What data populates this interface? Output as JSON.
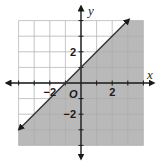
{
  "chart_data": {
    "type": "line",
    "title": "",
    "subtitle": "",
    "xlabel": "x",
    "ylabel": "y",
    "origin_label": "O",
    "xlim": [
      -4,
      4
    ],
    "ylim": [
      -4,
      4
    ],
    "grid": true,
    "grid_step": 1,
    "x_tick_labels": [
      {
        "value": -2,
        "label": "−2"
      },
      {
        "value": 2,
        "label": "2"
      }
    ],
    "y_tick_labels": [
      {
        "value": 2,
        "label": "2"
      },
      {
        "value": -2,
        "label": "−2"
      }
    ],
    "series": [
      {
        "name": "boundary line y = x + 1",
        "equation": "y = x + 1",
        "slope": 1,
        "intercept": 1,
        "style": "solid",
        "arrows": "both",
        "points": [
          {
            "x": -3.9,
            "y": -2.9
          },
          {
            "x": -1,
            "y": 0
          },
          {
            "x": 0,
            "y": 1
          },
          {
            "x": 3,
            "y": 4
          }
        ]
      }
    ],
    "shaded_region": {
      "inequality": "y ≤ x + 1",
      "side": "below-right of line",
      "color": "#b9b9b9"
    },
    "legend": null
  },
  "colors": {
    "shade": "#b9b9b9",
    "grid_light": "#dcdcdc",
    "grid_dark": "#9a9a9a",
    "axis": "#1a1a1a",
    "line": "#333333"
  }
}
